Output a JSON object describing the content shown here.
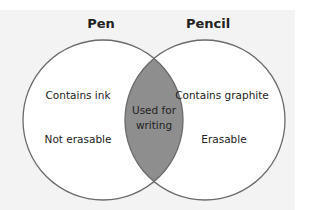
{
  "diagram": {
    "type": "venn",
    "sets": [
      {
        "name": "Pen",
        "unique": [
          "Contains ink",
          "Not erasable"
        ]
      },
      {
        "name": "Pencil",
        "unique": [
          "Contains graphite",
          "Erasable"
        ]
      }
    ],
    "intersection": {
      "line1": "Used for",
      "line2": "writing"
    },
    "colors": {
      "background": "#f3f3f3",
      "circle_fill": "#ffffff",
      "circle_stroke": "#6b6b6b",
      "intersection_fill": "#8e8e8e"
    }
  }
}
